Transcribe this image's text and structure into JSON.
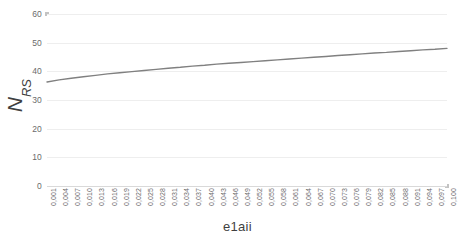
{
  "chart_data": {
    "type": "line",
    "title": "",
    "xlabel": "e1aii",
    "ylabel": "N_RS",
    "ylabel_main": "N",
    "ylabel_sub": "RS",
    "xlim": [
      0.001,
      0.1
    ],
    "ylim": [
      0,
      60
    ],
    "grid": true,
    "grid_orientation": "horizontal",
    "legend": "none",
    "line_color": "#808080",
    "grid_color": "#eeeeee",
    "axis_color": "#d4d4d4",
    "y_ticks": [
      0,
      10,
      20,
      30,
      40,
      50,
      60
    ],
    "y_tick_labels": [
      "0",
      "10",
      "20",
      "30",
      "40",
      "50",
      "60"
    ],
    "categories": [
      "0,001",
      "0,004",
      "0,007",
      "0,010",
      "0,013",
      "0,016",
      "0,019",
      "0,022",
      "0,025",
      "0,028",
      "0,031",
      "0,034",
      "0,037",
      "0,040",
      "0,043",
      "0,046",
      "0,049",
      "0,052",
      "0,055",
      "0,058",
      "0,061",
      "0,064",
      "0,067",
      "0,070",
      "0,073",
      "0,076",
      "0,079",
      "0,082",
      "0,085",
      "0,088",
      "0,091",
      "0,094",
      "0,097",
      "0,100"
    ],
    "x": [
      0.001,
      0.004,
      0.007,
      0.01,
      0.013,
      0.016,
      0.019,
      0.022,
      0.025,
      0.028,
      0.031,
      0.034,
      0.037,
      0.04,
      0.043,
      0.046,
      0.049,
      0.052,
      0.055,
      0.058,
      0.061,
      0.064,
      0.067,
      0.07,
      0.073,
      0.076,
      0.079,
      0.082,
      0.085,
      0.088,
      0.091,
      0.094,
      0.097,
      0.1
    ],
    "series": [
      {
        "name": "N_RS",
        "values": [
          36.3,
          37.0,
          37.6,
          38.1,
          38.6,
          39.1,
          39.5,
          39.9,
          40.3,
          40.7,
          41.1,
          41.4,
          41.8,
          42.1,
          42.5,
          42.8,
          43.1,
          43.4,
          43.7,
          44.0,
          44.3,
          44.6,
          44.9,
          45.2,
          45.5,
          45.8,
          46.1,
          46.4,
          46.6,
          46.9,
          47.2,
          47.5,
          47.7,
          48.0
        ]
      }
    ]
  }
}
